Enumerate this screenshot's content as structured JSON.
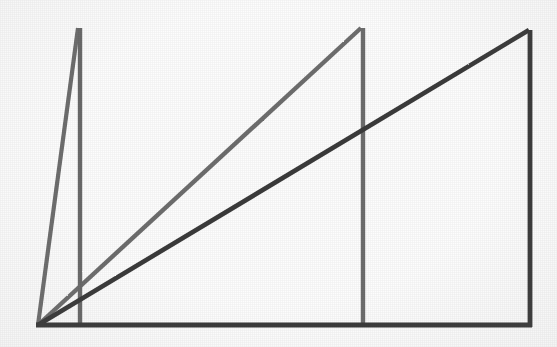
{
  "figure": {
    "background_color": "#fdfdfd",
    "width": 557,
    "height": 347,
    "baseline_label": "baseline",
    "origin_label": "common origin"
  },
  "colors": {
    "dark_stroke": "#3a3a3a",
    "mid_stroke": "#6e6e6e",
    "light_stroke": "#7d7d7d",
    "background": "#fdfdfd"
  },
  "chart_data": {
    "type": "line",
    "subtitle": "",
    "xlabel": "",
    "ylabel": "",
    "xlim": [
      0,
      557
    ],
    "ylim": [
      347,
      0
    ],
    "grid": false,
    "legend": "none",
    "annotations": [],
    "origin": {
      "x": 38,
      "y": 325
    },
    "baseline": {
      "x1": 38,
      "y1": 325,
      "x2": 532,
      "y2": 325
    },
    "series": [
      {
        "name": "triangle-1-narrow",
        "role": "steepest",
        "color": "#6e6e6e",
        "stroke_width": 4,
        "apex": {
          "x": 78,
          "y": 28
        },
        "base_x": 80,
        "hypotenuse": {
          "x1": 38,
          "y1": 325,
          "x2": 78,
          "y2": 28
        },
        "vertical": {
          "x1": 80,
          "y1": 28,
          "x2": 80,
          "y2": 325
        }
      },
      {
        "name": "triangle-2-middle",
        "role": "medium",
        "color": "#6e6e6e",
        "stroke_width": 4,
        "apex": {
          "x": 361,
          "y": 28
        },
        "base_x": 363,
        "hypotenuse": {
          "x1": 38,
          "y1": 325,
          "x2": 361,
          "y2": 28
        },
        "vertical": {
          "x1": 363,
          "y1": 28,
          "x2": 363,
          "y2": 325
        }
      },
      {
        "name": "triangle-3-wide",
        "role": "shallowest",
        "color": "#3a3a3a",
        "stroke_width": 4,
        "apex": {
          "x": 529,
          "y": 30
        },
        "base_x": 530,
        "hypotenuse": {
          "x1": 38,
          "y1": 325,
          "x2": 529,
          "y2": 30
        },
        "vertical": {
          "x1": 530,
          "y1": 30,
          "x2": 530,
          "y2": 325
        }
      }
    ],
    "intersections": [
      {
        "name": "dark-hypotenuse-crosses-middle-vertical",
        "x": 363,
        "y": 135
      }
    ]
  }
}
